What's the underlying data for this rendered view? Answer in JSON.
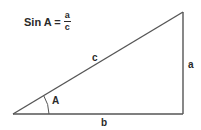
{
  "formula": {
    "lhs": "Sin A =",
    "numerator": "a",
    "denominator": "c"
  },
  "triangle": {
    "vertices": {
      "A": [
        13,
        114
      ],
      "top": [
        183,
        12
      ],
      "right_angle": [
        183,
        114
      ]
    },
    "side_labels": {
      "hypotenuse": "c",
      "opposite": "a",
      "adjacent": "b"
    },
    "angle_label": "A"
  },
  "colors": {
    "line": "#555555",
    "text": "#2a2a2a",
    "background": "#ffffff"
  }
}
